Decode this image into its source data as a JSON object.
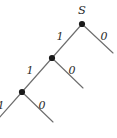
{
  "figure": {
    "kind": "binary-code-tree",
    "width": 117,
    "height": 138,
    "background_color": "#ffffff",
    "edge_color": "#6e6e6e",
    "node_color": "#1a1a1a",
    "text_color": "#2b2b2b",
    "root_label": "S",
    "description_visible_text": [
      "S",
      "1",
      "0",
      "1",
      "0",
      "1",
      "0"
    ]
  },
  "nodes": [
    {
      "id": "root",
      "label": "S",
      "x": 82,
      "y": 24,
      "radius": 3.1,
      "label_x": 82,
      "label_y": 11
    },
    {
      "id": "n1",
      "label": "",
      "x": 52,
      "y": 58,
      "radius": 3.1
    },
    {
      "id": "n2",
      "label": "",
      "x": 22,
      "y": 92,
      "radius": 3.1
    }
  ],
  "edges": [
    {
      "id": "e-root-1",
      "label": "1",
      "x1": 82,
      "y1": 24,
      "x2": 52,
      "y2": 58,
      "label_x": 60,
      "label_y": 37
    },
    {
      "id": "e-root-0",
      "label": "0",
      "x1": 82,
      "y1": 24,
      "x2": 113,
      "y2": 53,
      "label_x": 104,
      "label_y": 37
    },
    {
      "id": "e-n1-1",
      "label": "1",
      "x1": 52,
      "y1": 58,
      "x2": 22,
      "y2": 92,
      "label_x": 30,
      "label_y": 71
    },
    {
      "id": "e-n1-0",
      "label": "0",
      "x1": 52,
      "y1": 58,
      "x2": 83,
      "y2": 88,
      "label_x": 72,
      "label_y": 71
    },
    {
      "id": "e-n2-1",
      "label": "1",
      "x1": 22,
      "y1": 92,
      "x2": -8,
      "y2": 126,
      "label_x": 1,
      "label_y": 106
    },
    {
      "id": "e-n2-0",
      "label": "0",
      "x1": 22,
      "y1": 92,
      "x2": 53,
      "y2": 122,
      "label_x": 42,
      "label_y": 106
    }
  ]
}
